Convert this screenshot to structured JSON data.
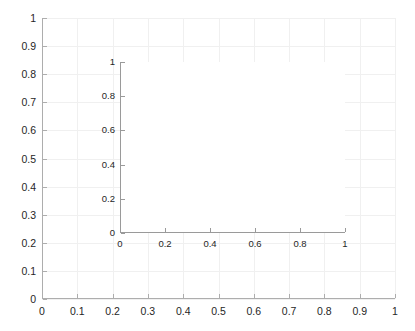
{
  "figure": {
    "background_color": "#ffffff",
    "axis_color": "#adadad",
    "grid_color": "#f0f0f0",
    "tick_label_color": "#262626"
  },
  "chart_data": [
    {
      "type": "line",
      "name": "main-axes",
      "title": "",
      "xlabel": "",
      "ylabel": "",
      "xlim": [
        0,
        1
      ],
      "ylim": [
        0,
        1
      ],
      "grid": true,
      "legend": null,
      "series": [],
      "xticks": [
        0,
        0.1,
        0.2,
        0.3,
        0.4,
        0.5,
        0.6,
        0.7,
        0.8,
        0.9,
        1
      ],
      "yticks": [
        0,
        0.1,
        0.2,
        0.3,
        0.4,
        0.5,
        0.6,
        0.7,
        0.8,
        0.9,
        1
      ],
      "xticklabels": [
        "0",
        "0.1",
        "0.2",
        "0.3",
        "0.4",
        "0.5",
        "0.6",
        "0.7",
        "0.8",
        "0.9",
        "1"
      ],
      "yticklabels": [
        "0",
        "0.1",
        "0.2",
        "0.3",
        "0.4",
        "0.5",
        "0.6",
        "0.7",
        "0.8",
        "0.9",
        "1"
      ]
    },
    {
      "type": "line",
      "name": "inset-axes",
      "title": "",
      "xlabel": "",
      "ylabel": "",
      "xlim": [
        0,
        1
      ],
      "ylim": [
        0,
        1
      ],
      "grid": false,
      "legend": null,
      "series": [],
      "xticks": [
        0,
        0.2,
        0.4,
        0.6,
        0.8,
        1
      ],
      "yticks": [
        0,
        0.2,
        0.4,
        0.6,
        0.8,
        1
      ],
      "xticklabels": [
        "0",
        "0.2",
        "0.4",
        "0.6",
        "0.8",
        "1"
      ],
      "yticklabels": [
        "0",
        "0.2",
        "0.4",
        "0.6",
        "0.8",
        "1"
      ]
    }
  ]
}
